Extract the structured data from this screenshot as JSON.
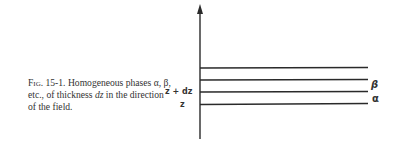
{
  "figure": {
    "label": "Fig. 15-1.",
    "caption_parts": {
      "text1": "Homogeneous phases α, β, etc., of thickness ",
      "var": "dz",
      "text2": " in the direction of the field."
    },
    "axis_labels": {
      "upper": "z + dz",
      "lower": "z"
    },
    "phase_labels": {
      "beta": "β",
      "alpha": "α"
    },
    "layers": 4
  }
}
